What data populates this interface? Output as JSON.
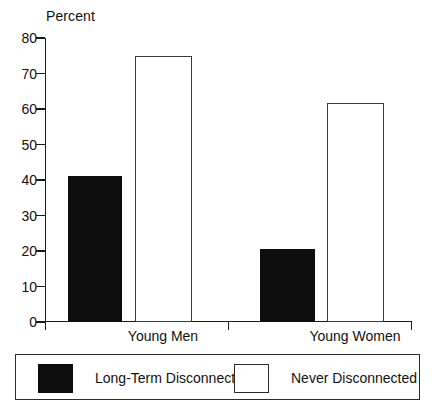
{
  "chart_data": {
    "type": "bar",
    "title": "",
    "subtitle": "",
    "xlabel": "",
    "ylabel": "Percent",
    "ylim": [
      0,
      80
    ],
    "yticks": [
      0,
      10,
      20,
      30,
      40,
      50,
      60,
      70,
      80
    ],
    "ytick_labels": [
      "0",
      "10",
      "20",
      "30",
      "40",
      "50",
      "60",
      "70",
      "80"
    ],
    "grid": false,
    "legend_position": "bottom",
    "categories": [
      "Young Men",
      "Young Women"
    ],
    "series": [
      {
        "name": "Long-Term Disconnected",
        "swatch": "filled",
        "color": "#0d0d0d",
        "values": [
          41,
          20.6
        ]
      },
      {
        "name": "Never Disconnected",
        "swatch": "hollow",
        "color": "#ffffff",
        "values": [
          75,
          61.8
        ]
      }
    ]
  },
  "axis": {
    "unit_label": "Percent"
  },
  "legend": {
    "entries": [
      {
        "label": "Long-Term Disconnected",
        "swatch": "filled"
      },
      {
        "label": "Never Disconnected",
        "swatch": "hollow"
      }
    ]
  }
}
